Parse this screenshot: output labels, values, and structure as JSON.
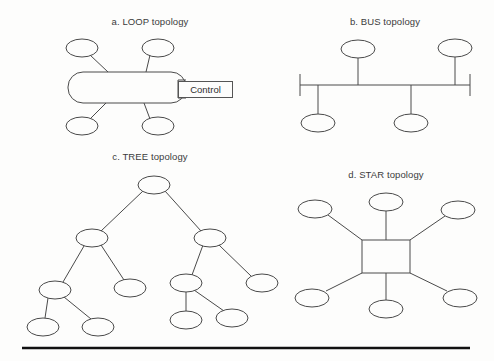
{
  "figure": {
    "background_color": "#fdfdfc",
    "stroke_color": "#4a4a4a",
    "rule_color": "#111111",
    "panels": [
      {
        "id": "loop",
        "caption": "a. LOOP topology",
        "caption_x": 150,
        "caption_y": 22,
        "type": "loop",
        "ring": {
          "x": 68,
          "y": 72,
          "width": 118,
          "height": 31,
          "radius": 15
        },
        "control_label": "Control",
        "control_box": {
          "x": 178,
          "y": 81,
          "width": 53,
          "height": 15
        },
        "control_connector": [
          [
            186,
            80
          ],
          [
            178,
            80
          ],
          [
            178,
            98
          ],
          [
            186,
            98
          ]
        ],
        "nodes": [
          {
            "name": "loop-node-top-left",
            "cx": 82,
            "cy": 48,
            "rx": 16,
            "ry": 9
          },
          {
            "name": "loop-node-top-right",
            "cx": 158,
            "cy": 48,
            "rx": 16,
            "ry": 9
          },
          {
            "name": "loop-node-bottom-left",
            "cx": 82,
            "cy": 126,
            "rx": 16,
            "ry": 9
          },
          {
            "name": "loop-node-bottom-right",
            "cx": 158,
            "cy": 126,
            "rx": 16,
            "ry": 9
          }
        ],
        "links": [
          [
            90,
            55,
            108,
            72
          ],
          [
            150,
            55,
            146,
            72
          ],
          [
            90,
            119,
            106,
            103
          ],
          [
            150,
            119,
            144,
            103
          ]
        ]
      },
      {
        "id": "bus",
        "caption": "b. BUS topology",
        "caption_x": 385,
        "caption_y": 22,
        "type": "bus",
        "backbone": {
          "x1": 300,
          "y1": 85,
          "x2": 470,
          "y2": 85
        },
        "terminators": [
          {
            "name": "bus-terminator-left",
            "x": 300,
            "y1": 74,
            "y2": 96
          },
          {
            "name": "bus-terminator-right",
            "x": 470,
            "y1": 74,
            "y2": 96
          }
        ],
        "nodes": [
          {
            "name": "bus-node-top-left",
            "cx": 358,
            "cy": 49,
            "rx": 17,
            "ry": 9
          },
          {
            "name": "bus-node-top-right",
            "cx": 455,
            "cy": 48,
            "rx": 17,
            "ry": 9
          },
          {
            "name": "bus-node-bottom-left",
            "cx": 318,
            "cy": 123,
            "rx": 17,
            "ry": 9
          },
          {
            "name": "bus-node-bottom-right",
            "cx": 411,
            "cy": 123,
            "rx": 17,
            "ry": 9
          }
        ],
        "drops": [
          [
            358,
            58,
            358,
            85
          ],
          [
            455,
            57,
            455,
            85
          ],
          [
            318,
            85,
            318,
            114
          ],
          [
            411,
            85,
            411,
            114
          ]
        ]
      },
      {
        "id": "tree",
        "caption": "c. TREE topology",
        "caption_x": 150,
        "caption_y": 157,
        "type": "tree",
        "nodes": [
          {
            "name": "tree-node-root",
            "cx": 154,
            "cy": 185,
            "rx": 16,
            "ry": 9
          },
          {
            "name": "tree-node-left",
            "cx": 92,
            "cy": 238,
            "rx": 16,
            "ry": 9
          },
          {
            "name": "tree-node-right",
            "cx": 210,
            "cy": 238,
            "rx": 16,
            "ry": 9
          },
          {
            "name": "tree-node-left-child-a",
            "cx": 55,
            "cy": 290,
            "rx": 16,
            "ry": 9
          },
          {
            "name": "tree-node-left-child-b",
            "cx": 130,
            "cy": 288,
            "rx": 16,
            "ry": 9
          },
          {
            "name": "tree-node-right-child-a",
            "cx": 186,
            "cy": 283,
            "rx": 16,
            "ry": 9
          },
          {
            "name": "tree-node-right-child-b",
            "cx": 262,
            "cy": 283,
            "rx": 16,
            "ry": 9
          },
          {
            "name": "tree-leaf-a",
            "cx": 43,
            "cy": 327,
            "rx": 16,
            "ry": 9
          },
          {
            "name": "tree-leaf-b",
            "cx": 98,
            "cy": 327,
            "rx": 16,
            "ry": 9
          },
          {
            "name": "tree-leaf-c",
            "cx": 186,
            "cy": 320,
            "rx": 16,
            "ry": 9
          },
          {
            "name": "tree-leaf-d",
            "cx": 232,
            "cy": 318,
            "rx": 16,
            "ry": 9
          }
        ],
        "links": [
          [
            143,
            191,
            101,
            231
          ],
          [
            165,
            191,
            201,
            231
          ],
          [
            84,
            246,
            63,
            282
          ],
          [
            101,
            245,
            124,
            280
          ],
          [
            203,
            245,
            192,
            275
          ],
          [
            219,
            245,
            251,
            276
          ],
          [
            48,
            298,
            45,
            318
          ],
          [
            64,
            297,
            91,
            319
          ],
          [
            186,
            292,
            186,
            311
          ],
          [
            194,
            290,
            224,
            311
          ]
        ]
      },
      {
        "id": "star",
        "caption": "d. STAR topology",
        "caption_x": 386,
        "caption_y": 175,
        "type": "star",
        "hub": {
          "x": 362,
          "y": 240,
          "width": 48,
          "height": 33
        },
        "nodes": [
          {
            "name": "star-node-top-left",
            "cx": 315,
            "cy": 209,
            "rx": 17,
            "ry": 9
          },
          {
            "name": "star-node-top-center",
            "cx": 386,
            "cy": 202,
            "rx": 17,
            "ry": 9
          },
          {
            "name": "star-node-top-right",
            "cx": 458,
            "cy": 210,
            "rx": 17,
            "ry": 9
          },
          {
            "name": "star-node-bottom-left",
            "cx": 312,
            "cy": 298,
            "rx": 17,
            "ry": 9
          },
          {
            "name": "star-node-bottom-center",
            "cx": 386,
            "cy": 309,
            "rx": 17,
            "ry": 9
          },
          {
            "name": "star-node-bottom-right",
            "cx": 460,
            "cy": 298,
            "rx": 17,
            "ry": 9
          }
        ],
        "spokes": [
          [
            328,
            215,
            362,
            240
          ],
          [
            386,
            211,
            386,
            240
          ],
          [
            445,
            216,
            410,
            240
          ],
          [
            326,
            291,
            362,
            273
          ],
          [
            386,
            273,
            386,
            300
          ],
          [
            447,
            291,
            410,
            273
          ]
        ]
      }
    ],
    "bottom_rule": {
      "x1": 22,
      "y1": 348,
      "x2": 470,
      "y2": 348
    }
  }
}
